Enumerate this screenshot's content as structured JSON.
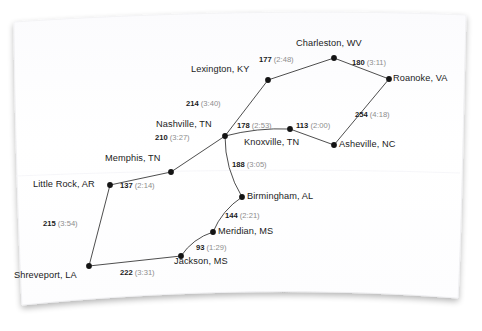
{
  "figure": {
    "kind": "weighted-graph-network-diagram",
    "background_color": "#ffffff",
    "card_color": "#ffffff",
    "node_color": "#141414",
    "edge_color": "#3a3a3a",
    "miles_text_color": "#1b1b1b",
    "time_text_color": "#8d8d8d"
  },
  "nodes": [
    {
      "id": "charleston",
      "label": "Charleston, WV",
      "x": 334,
      "y": 58,
      "label_x": 296,
      "label_y": 38,
      "label_align": "left"
    },
    {
      "id": "roanoke",
      "label": "Roanoke, VA",
      "x": 389,
      "y": 79,
      "label_x": 393,
      "label_y": 73,
      "label_align": "left"
    },
    {
      "id": "lexington",
      "label": "Lexington, KY",
      "x": 268,
      "y": 80,
      "label_x": 191,
      "label_y": 64,
      "label_align": "left"
    },
    {
      "id": "nashville",
      "label": "Nashville, TN",
      "x": 225,
      "y": 136,
      "label_x": 156,
      "label_y": 119,
      "label_align": "left"
    },
    {
      "id": "knoxville",
      "label": "Knoxville, TN",
      "x": 290,
      "y": 129,
      "label_x": 244,
      "label_y": 137,
      "label_align": "left"
    },
    {
      "id": "asheville",
      "label": "Asheville, NC",
      "x": 334,
      "y": 145,
      "label_x": 339,
      "label_y": 139,
      "label_align": "left"
    },
    {
      "id": "memphis",
      "label": "Memphis, TN",
      "x": 171,
      "y": 172,
      "label_x": 105,
      "label_y": 153,
      "label_align": "left"
    },
    {
      "id": "littlerock",
      "label": "Little Rock, AR",
      "x": 110,
      "y": 185,
      "label_x": 33,
      "label_y": 179,
      "label_align": "left"
    },
    {
      "id": "birmingham",
      "label": "Birmingham, AL",
      "x": 242,
      "y": 197,
      "label_x": 247,
      "label_y": 191,
      "label_align": "left"
    },
    {
      "id": "meridian",
      "label": "Meridian, MS",
      "x": 213,
      "y": 232,
      "label_x": 218,
      "label_y": 226,
      "label_align": "left"
    },
    {
      "id": "jackson",
      "label": "Jackson, MS",
      "x": 181,
      "y": 256,
      "label_x": 174,
      "label_y": 256,
      "label_align": "left"
    },
    {
      "id": "shreveport",
      "label": "Shreveport, LA",
      "x": 89,
      "y": 266,
      "label_x": 14,
      "label_y": 270,
      "label_align": "left"
    }
  ],
  "edges": [
    {
      "from": "lexington",
      "to": "charleston",
      "miles": "177",
      "time": "(2:48)",
      "label_x": 259,
      "label_y": 55
    },
    {
      "from": "charleston",
      "to": "roanoke",
      "miles": "180",
      "time": "(3:11)",
      "label_x": 352,
      "label_y": 58
    },
    {
      "from": "roanoke",
      "to": "asheville",
      "miles": "254",
      "time": "(4:18)",
      "label_x": 355,
      "label_y": 110
    },
    {
      "from": "nashville",
      "to": "lexington",
      "miles": "214",
      "time": "(3:40)",
      "label_x": 186,
      "label_y": 99
    },
    {
      "from": "nashville",
      "to": "knoxville",
      "miles": "178",
      "time": "(2:53)",
      "label_x": 237,
      "label_y": 121
    },
    {
      "from": "knoxville",
      "to": "asheville",
      "miles": "113",
      "time": "(2:00)",
      "label_x": 296,
      "label_y": 121
    },
    {
      "from": "memphis",
      "to": "nashville",
      "miles": "210",
      "time": "(3:27)",
      "label_x": 155,
      "label_y": 133
    },
    {
      "from": "littlerock",
      "to": "memphis",
      "miles": "137",
      "time": "(2:14)",
      "label_x": 120,
      "label_y": 181
    },
    {
      "from": "nashville",
      "to": "birmingham",
      "miles": "188",
      "time": "(3:05)",
      "label_x": 232,
      "label_y": 160
    },
    {
      "from": "birmingham",
      "to": "meridian",
      "miles": "144",
      "time": "(2:21)",
      "label_x": 225,
      "label_y": 211
    },
    {
      "from": "meridian",
      "to": "jackson",
      "miles": "93",
      "time": "(1:29)",
      "label_x": 196,
      "label_y": 243
    },
    {
      "from": "littlerock",
      "to": "shreveport",
      "miles": "215",
      "time": "(3:54)",
      "label_x": 43,
      "label_y": 219
    },
    {
      "from": "shreveport",
      "to": "jackson",
      "miles": "222",
      "time": "(3:31)",
      "label_x": 120,
      "label_y": 268
    }
  ],
  "curved_edges": [
    {
      "from": "nashville",
      "to": "knoxville",
      "bow": -5
    },
    {
      "from": "nashville",
      "to": "birmingham",
      "bow": 9
    },
    {
      "from": "birmingham",
      "to": "meridian",
      "bow": 7
    },
    {
      "from": "meridian",
      "to": "jackson",
      "bow": 7
    }
  ]
}
